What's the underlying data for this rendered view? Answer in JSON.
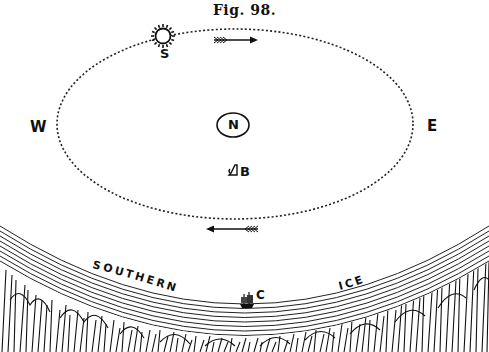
{
  "figure": {
    "title": "Fig. 98.",
    "compass": {
      "west": "W",
      "east": "E"
    },
    "labels": {
      "sun": "S",
      "pole": "N",
      "ship_b": "B",
      "ship_c": "C",
      "ice_left": "SOUTHERN",
      "ice_right": "ICE"
    },
    "orbit": {
      "style": "dotted",
      "direction_top": "left-to-right",
      "direction_bottom": "right-to-left"
    },
    "colors": {
      "ink": "#111111",
      "paper": "#ffffff"
    }
  }
}
